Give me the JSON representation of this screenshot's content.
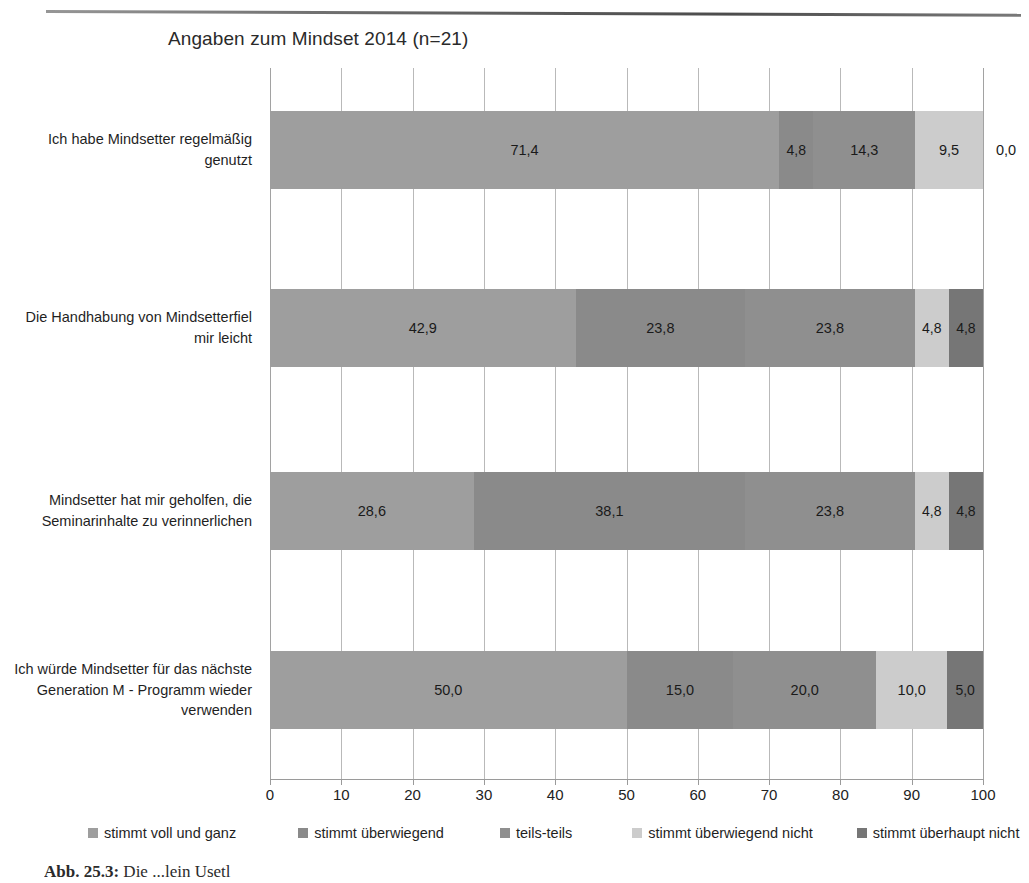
{
  "chart_data": {
    "type": "bar",
    "subtype": "stacked-horizontal-100",
    "title": "Angaben zum Mindset 2014 (n=21)",
    "xlabel": "",
    "ylabel": "",
    "xlim": [
      0,
      100
    ],
    "xticks": [
      "0",
      "10",
      "20",
      "30",
      "40",
      "50",
      "60",
      "70",
      "80",
      "90",
      "100"
    ],
    "grid": true,
    "legend_position": "bottom",
    "categories": [
      "Ich habe Mindsetter regelmäßig genutzt",
      "Die Handhabung von Mindsetterfiel mir leicht",
      "Mindsetter hat mir geholfen, die Seminarinhalte zu verinnerlichen",
      "Ich würde Mindsetter für das nächste Generation M - Programm wieder verwenden"
    ],
    "series": [
      {
        "name": "stimmt voll und ganz",
        "color": "#9e9e9e",
        "values": [
          71.4,
          42.9,
          28.6,
          50.0
        ],
        "labels": [
          "71,4",
          "42,9",
          "28,6",
          "50,0"
        ]
      },
      {
        "name": "stimmt überwiegend",
        "color": "#8a8a8a",
        "values": [
          4.8,
          23.8,
          38.1,
          15.0
        ],
        "labels": [
          "4,8",
          "23,8",
          "38,1",
          "15,0"
        ]
      },
      {
        "name": "teils-teils",
        "color": "#8f8f8f",
        "values": [
          14.3,
          23.8,
          23.8,
          20.0
        ],
        "labels": [
          "14,3",
          "23,8",
          "23,8",
          "20,0"
        ]
      },
      {
        "name": "stimmt überwiegend nicht",
        "color": "#cccccc",
        "values": [
          9.5,
          4.8,
          4.8,
          10.0
        ],
        "labels": [
          "9,5",
          "4,8",
          "4,8",
          "10,0"
        ]
      },
      {
        "name": "stimmt überhaupt nicht",
        "color": "#767676",
        "values": [
          0.0,
          4.8,
          4.8,
          5.0
        ],
        "labels": [
          "0,0",
          "4,8",
          "4,8",
          "5,0"
        ]
      }
    ]
  },
  "caption": {
    "number": "Abb. 25.3:",
    "text": "Die ...lein Usetl"
  }
}
